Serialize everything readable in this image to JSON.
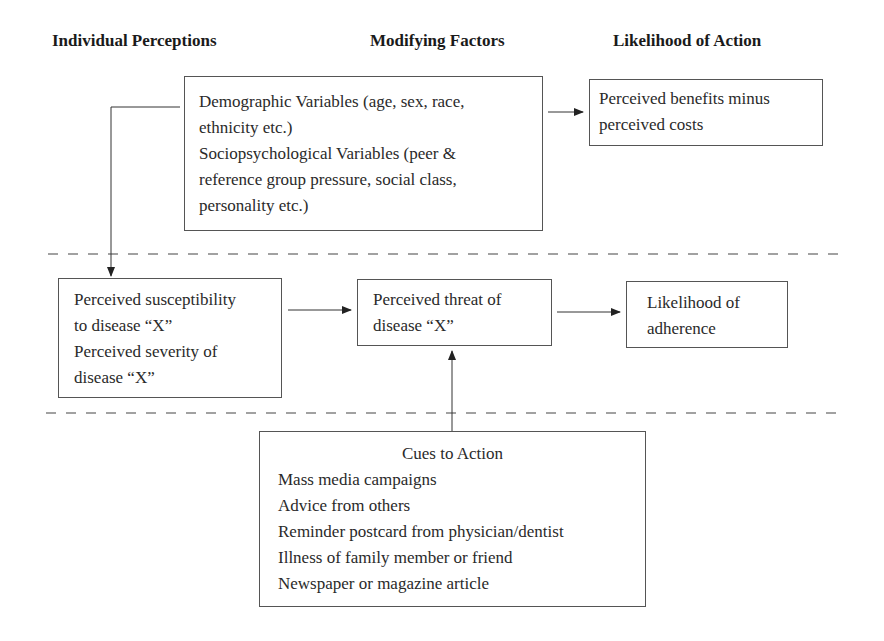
{
  "headers": {
    "individual": "Individual Perceptions",
    "modifying": "Modifying Factors",
    "likelihood": "Likelihood of Action"
  },
  "nodes": {
    "modifying_factors": {
      "lines": [
        "Demographic Variables (age, sex, race,",
        "ethnicity etc.)",
        "Sociopsychological Variables (peer &",
        "reference group pressure, social class,",
        "personality etc.)"
      ]
    },
    "benefits_costs": {
      "lines": [
        "Perceived benefits minus",
        "perceived costs"
      ]
    },
    "perceptions": {
      "lines": [
        "Perceived susceptibility",
        "to disease “X”",
        "Perceived severity of",
        "disease “X”"
      ]
    },
    "threat": {
      "lines": [
        "Perceived threat of",
        "disease “X”"
      ]
    },
    "adherence": {
      "lines": [
        "Likelihood of",
        "adherence"
      ]
    },
    "cues": {
      "title": "Cues to Action",
      "items": [
        "Mass media campaigns",
        "Advice from others",
        "Reminder postcard from physician/dentist",
        "Illness of family member or friend",
        "Newspaper or magazine article"
      ]
    }
  },
  "edges": [
    {
      "from": "modifying_factors",
      "to": "benefits_costs"
    },
    {
      "from": "modifying_factors",
      "to": "perceptions"
    },
    {
      "from": "perceptions",
      "to": "threat"
    },
    {
      "from": "threat",
      "to": "adherence"
    },
    {
      "from": "cues",
      "to": "threat"
    }
  ],
  "style": {
    "line_color": "#444444",
    "border_color": "#555555"
  }
}
